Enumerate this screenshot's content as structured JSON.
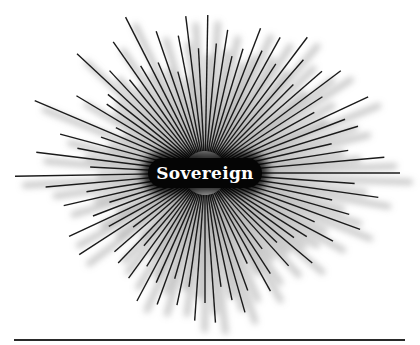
{
  "label": {
    "text": "Sovereign",
    "background": "#050505",
    "color": "#ffffff"
  },
  "starburst": {
    "center": [
      205,
      173
    ],
    "inner_radius": 22,
    "ray_color": "#1a1a1a",
    "shadow_color": "#9a9a9a",
    "shadow_offset": [
      10,
      9
    ],
    "rays": [
      [
        0,
        195
      ],
      [
        4,
        150
      ],
      [
        8,
        175
      ],
      [
        12,
        130
      ],
      [
        16,
        150
      ],
      [
        20,
        165
      ],
      [
        24,
        120
      ],
      [
        28,
        145
      ],
      [
        32,
        120
      ],
      [
        36,
        110
      ],
      [
        40,
        140
      ],
      [
        44,
        100
      ],
      [
        48,
        125
      ],
      [
        53,
        95
      ],
      [
        57,
        120
      ],
      [
        61,
        135
      ],
      [
        65,
        100
      ],
      [
        70,
        125
      ],
      [
        74,
        145
      ],
      [
        78,
        130
      ],
      [
        82,
        115
      ],
      [
        86,
        150
      ],
      [
        90,
        130
      ],
      [
        94,
        148
      ],
      [
        98,
        115
      ],
      [
        102,
        135
      ],
      [
        106,
        110
      ],
      [
        110,
        140
      ],
      [
        114,
        120
      ],
      [
        118,
        145
      ],
      [
        122,
        110
      ],
      [
        126,
        130
      ],
      [
        130,
        95
      ],
      [
        134,
        125
      ],
      [
        139,
        120
      ],
      [
        143,
        90
      ],
      [
        147,
        150
      ],
      [
        151,
        110
      ],
      [
        155,
        150
      ],
      [
        159,
        120
      ],
      [
        163,
        100
      ],
      [
        167,
        145
      ],
      [
        171,
        120
      ],
      [
        175,
        160
      ],
      [
        179,
        190
      ],
      [
        183,
        115
      ],
      [
        187,
        170
      ],
      [
        191,
        130
      ],
      [
        195,
        150
      ],
      [
        199,
        110
      ],
      [
        203,
        185
      ],
      [
        207,
        100
      ],
      [
        211,
        150
      ],
      [
        215,
        120
      ],
      [
        219,
        125
      ],
      [
        223,
        175
      ],
      [
        227,
        140
      ],
      [
        231,
        120
      ],
      [
        235,
        160
      ],
      [
        239,
        125
      ],
      [
        243,
        175
      ],
      [
        247,
        120
      ],
      [
        251,
        150
      ],
      [
        255,
        105
      ],
      [
        259,
        140
      ],
      [
        263,
        158
      ],
      [
        267,
        125
      ],
      [
        271,
        158
      ],
      [
        275,
        130
      ],
      [
        279,
        145
      ],
      [
        283,
        120
      ],
      [
        287,
        130
      ],
      [
        291,
        155
      ],
      [
        295,
        135
      ],
      [
        299,
        155
      ],
      [
        303,
        130
      ],
      [
        307,
        170
      ],
      [
        311,
        150
      ],
      [
        315,
        125
      ],
      [
        319,
        155
      ],
      [
        323,
        170
      ],
      [
        327,
        140
      ],
      [
        331,
        125
      ],
      [
        335,
        180
      ],
      [
        339,
        150
      ],
      [
        343,
        160
      ],
      [
        347,
        130
      ],
      [
        351,
        145
      ],
      [
        355,
        180
      ]
    ]
  },
  "bottom_rule": {
    "x1": 14,
    "x2": 405,
    "y": 340,
    "color": "#2a2a2a"
  }
}
